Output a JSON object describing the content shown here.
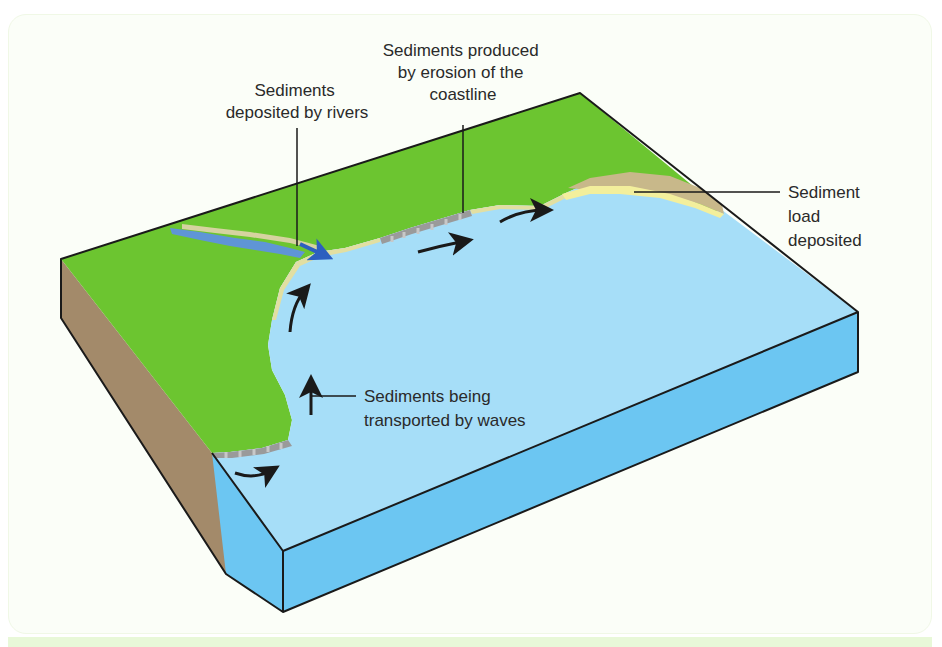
{
  "diagram": {
    "labels": {
      "rivers": [
        "Sediments",
        "deposited by rivers"
      ],
      "erosion": [
        "Sediments produced",
        "by erosion of the",
        "coastline"
      ],
      "deposited": [
        "Sediment",
        "load",
        "deposited"
      ],
      "transport": [
        "Sediments being",
        "transported by waves"
      ]
    },
    "colors": {
      "land": "#6cc530",
      "sea_top": "#a6def8",
      "sea_side": "#6cc6f2",
      "soil_side": "#a38a6a",
      "beach": "#f3ef9c",
      "dune": "#c8b88a",
      "cliff": "#9a9a9a",
      "river": "#5f95d6",
      "outline": "#1a1a1a",
      "panel_bg": "#fbfef8",
      "bottom_bar": "#e8f8d8"
    }
  }
}
